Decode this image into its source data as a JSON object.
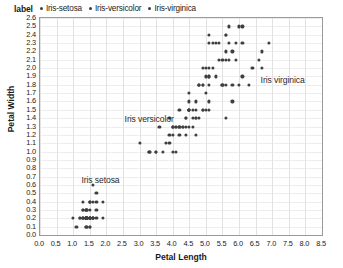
{
  "legend": {
    "title": "label",
    "entries": [
      {
        "label": "Iris-setosa",
        "color": "#3c3c3c"
      },
      {
        "label": "Iris-versicolor",
        "color": "#3c3c3c"
      },
      {
        "label": "Iris-virginica",
        "color": "#3c3c3c"
      }
    ]
  },
  "annotations": [
    {
      "text": "Iris setosa",
      "x": 1.25,
      "y": 0.72
    },
    {
      "text": "Iris versicolor",
      "x": 2.55,
      "y": 1.45
    },
    {
      "text": "Iris virginica",
      "x": 6.65,
      "y": 1.92
    }
  ],
  "chart_data": {
    "type": "scatter",
    "title": "",
    "xlabel": "Petal Length",
    "ylabel": "Petal Width",
    "xlim": [
      0.0,
      8.5
    ],
    "ylim": [
      0.0,
      2.6
    ],
    "grid": true,
    "legend_position": "top-left",
    "xticks": [
      "0.0",
      "0.5",
      "1.0",
      "1.5",
      "2.0",
      "2.5",
      "3.0",
      "3.5",
      "4.0",
      "4.5",
      "5.0",
      "5.5",
      "6.0",
      "6.5",
      "7.0",
      "7.5",
      "8.0",
      "8.5"
    ],
    "yticks": [
      "0.0",
      "0.1",
      "0.2",
      "0.3",
      "0.4",
      "0.5",
      "0.6",
      "0.7",
      "0.8",
      "0.9",
      "1.0",
      "1.1",
      "1.2",
      "1.3",
      "1.4",
      "1.5",
      "1.6",
      "1.7",
      "1.8",
      "1.9",
      "2.0",
      "2.1",
      "2.2",
      "2.3",
      "2.4",
      "2.5",
      "2.6"
    ],
    "marker_color": "#3f3f3f",
    "marker_size": 3.2,
    "series": [
      {
        "name": "Iris-setosa",
        "color": "#3f3f3f",
        "points": [
          [
            1.4,
            0.2
          ],
          [
            1.4,
            0.2
          ],
          [
            1.3,
            0.2
          ],
          [
            1.5,
            0.2
          ],
          [
            1.4,
            0.2
          ],
          [
            1.7,
            0.4
          ],
          [
            1.4,
            0.3
          ],
          [
            1.5,
            0.2
          ],
          [
            1.4,
            0.2
          ],
          [
            1.5,
            0.1
          ],
          [
            1.5,
            0.2
          ],
          [
            1.6,
            0.2
          ],
          [
            1.4,
            0.1
          ],
          [
            1.1,
            0.1
          ],
          [
            1.2,
            0.2
          ],
          [
            1.5,
            0.4
          ],
          [
            1.3,
            0.4
          ],
          [
            1.4,
            0.3
          ],
          [
            1.7,
            0.3
          ],
          [
            1.5,
            0.3
          ],
          [
            1.7,
            0.2
          ],
          [
            1.5,
            0.4
          ],
          [
            1.0,
            0.2
          ],
          [
            1.7,
            0.5
          ],
          [
            1.9,
            0.2
          ],
          [
            1.6,
            0.2
          ],
          [
            1.6,
            0.4
          ],
          [
            1.5,
            0.2
          ],
          [
            1.4,
            0.2
          ],
          [
            1.6,
            0.2
          ],
          [
            1.6,
            0.2
          ],
          [
            1.5,
            0.4
          ],
          [
            1.5,
            0.1
          ],
          [
            1.4,
            0.2
          ],
          [
            1.5,
            0.2
          ],
          [
            1.2,
            0.2
          ],
          [
            1.3,
            0.2
          ],
          [
            1.4,
            0.1
          ],
          [
            1.3,
            0.2
          ],
          [
            1.5,
            0.2
          ],
          [
            1.3,
            0.3
          ],
          [
            1.3,
            0.3
          ],
          [
            1.3,
            0.2
          ],
          [
            1.6,
            0.6
          ],
          [
            1.9,
            0.4
          ],
          [
            1.4,
            0.3
          ],
          [
            1.6,
            0.2
          ],
          [
            1.4,
            0.2
          ],
          [
            1.5,
            0.2
          ],
          [
            1.4,
            0.2
          ]
        ]
      },
      {
        "name": "Iris-versicolor",
        "color": "#3f3f3f",
        "points": [
          [
            4.7,
            1.4
          ],
          [
            4.5,
            1.5
          ],
          [
            4.9,
            1.5
          ],
          [
            4.0,
            1.3
          ],
          [
            4.6,
            1.5
          ],
          [
            4.5,
            1.3
          ],
          [
            4.7,
            1.6
          ],
          [
            3.3,
            1.0
          ],
          [
            4.6,
            1.3
          ],
          [
            3.9,
            1.4
          ],
          [
            3.5,
            1.0
          ],
          [
            4.2,
            1.5
          ],
          [
            4.0,
            1.0
          ],
          [
            4.7,
            1.4
          ],
          [
            3.6,
            1.3
          ],
          [
            4.4,
            1.4
          ],
          [
            4.5,
            1.5
          ],
          [
            4.1,
            1.0
          ],
          [
            4.5,
            1.5
          ],
          [
            3.9,
            1.1
          ],
          [
            4.8,
            1.8
          ],
          [
            4.0,
            1.3
          ],
          [
            4.9,
            1.5
          ],
          [
            4.7,
            1.2
          ],
          [
            4.3,
            1.3
          ],
          [
            4.4,
            1.4
          ],
          [
            4.8,
            1.4
          ],
          [
            5.0,
            1.7
          ],
          [
            4.5,
            1.5
          ],
          [
            3.5,
            1.0
          ],
          [
            3.8,
            1.1
          ],
          [
            3.7,
            1.0
          ],
          [
            3.9,
            1.2
          ],
          [
            5.1,
            1.6
          ],
          [
            4.5,
            1.5
          ],
          [
            4.5,
            1.6
          ],
          [
            4.7,
            1.5
          ],
          [
            4.4,
            1.3
          ],
          [
            4.1,
            1.3
          ],
          [
            4.0,
            1.3
          ],
          [
            4.4,
            1.2
          ],
          [
            4.6,
            1.4
          ],
          [
            4.0,
            1.2
          ],
          [
            3.3,
            1.0
          ],
          [
            4.2,
            1.3
          ],
          [
            4.2,
            1.2
          ],
          [
            4.2,
            1.3
          ],
          [
            4.3,
            1.3
          ],
          [
            3.0,
            1.1
          ],
          [
            4.1,
            1.3
          ]
        ]
      },
      {
        "name": "Iris-virginica",
        "color": "#3f3f3f",
        "points": [
          [
            6.0,
            2.5
          ],
          [
            5.1,
            1.9
          ],
          [
            5.9,
            2.1
          ],
          [
            5.6,
            1.8
          ],
          [
            5.8,
            2.2
          ],
          [
            6.6,
            2.1
          ],
          [
            4.5,
            1.7
          ],
          [
            6.3,
            1.8
          ],
          [
            5.8,
            1.8
          ],
          [
            6.1,
            2.5
          ],
          [
            5.1,
            2.0
          ],
          [
            5.3,
            1.9
          ],
          [
            5.5,
            2.1
          ],
          [
            5.0,
            2.0
          ],
          [
            5.1,
            2.4
          ],
          [
            5.3,
            2.3
          ],
          [
            5.5,
            1.8
          ],
          [
            6.7,
            2.2
          ],
          [
            6.9,
            2.3
          ],
          [
            5.0,
            1.5
          ],
          [
            5.7,
            2.3
          ],
          [
            4.9,
            2.0
          ],
          [
            6.7,
            2.0
          ],
          [
            4.9,
            1.8
          ],
          [
            5.7,
            2.1
          ],
          [
            6.0,
            1.8
          ],
          [
            4.8,
            1.8
          ],
          [
            4.9,
            1.8
          ],
          [
            5.6,
            2.1
          ],
          [
            5.8,
            1.6
          ],
          [
            6.1,
            1.9
          ],
          [
            6.4,
            2.0
          ],
          [
            5.6,
            2.2
          ],
          [
            5.1,
            1.5
          ],
          [
            5.6,
            1.4
          ],
          [
            6.1,
            2.3
          ],
          [
            5.6,
            2.4
          ],
          [
            5.5,
            1.8
          ],
          [
            4.8,
            1.8
          ],
          [
            5.4,
            2.1
          ],
          [
            5.6,
            2.4
          ],
          [
            5.1,
            2.3
          ],
          [
            5.1,
            1.9
          ],
          [
            5.9,
            2.3
          ],
          [
            5.7,
            2.5
          ],
          [
            5.2,
            2.3
          ],
          [
            5.0,
            1.9
          ],
          [
            5.2,
            2.0
          ],
          [
            5.4,
            2.3
          ],
          [
            5.1,
            1.8
          ]
        ]
      }
    ]
  }
}
